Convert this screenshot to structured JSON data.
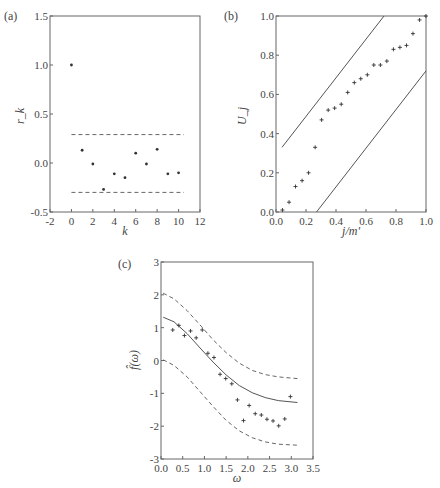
{
  "chart_data": [
    {
      "panel": "(a)",
      "type": "scatter",
      "title": "",
      "xlabel": "k",
      "ylabel": "r_k",
      "xlim": [
        -2,
        12
      ],
      "ylim": [
        -0.5,
        1.5
      ],
      "xticks": [
        "-2",
        "0",
        "2",
        "4",
        "6",
        "8",
        "10",
        "12"
      ],
      "yticks": [
        "-0.5",
        "0.0",
        "0.5",
        "1.0",
        "1.5"
      ],
      "x": [
        0,
        1,
        2,
        3,
        4,
        5,
        6,
        7,
        8,
        9,
        10
      ],
      "values": [
        1.0,
        0.13,
        -0.01,
        -0.27,
        -0.11,
        -0.15,
        0.1,
        -0.01,
        0.14,
        -0.11,
        -0.1
      ],
      "reference_lines": [
        {
          "style": "dashed",
          "y": 0.29,
          "x_range": [
            0,
            10.5
          ]
        },
        {
          "style": "dashed",
          "y": -0.3,
          "x_range": [
            0,
            10.5
          ]
        }
      ],
      "grid": false
    },
    {
      "panel": "(b)",
      "type": "scatter",
      "title": "",
      "xlabel": "j/m'",
      "ylabel": "U_j",
      "xlim": [
        0.0,
        1.0
      ],
      "ylim": [
        0.0,
        1.0
      ],
      "xticks": [
        "0.0",
        "0.2",
        "0.4",
        "0.6",
        "0.8",
        "1.0"
      ],
      "yticks": [
        "0.0",
        "0.2",
        "0.4",
        "0.6",
        "0.8",
        "1.0"
      ],
      "x": [
        0.043,
        0.087,
        0.13,
        0.174,
        0.217,
        0.261,
        0.304,
        0.348,
        0.391,
        0.435,
        0.478,
        0.522,
        0.565,
        0.609,
        0.652,
        0.696,
        0.739,
        0.783,
        0.826,
        0.87,
        0.913,
        0.957,
        1.0
      ],
      "values": [
        0.01,
        0.05,
        0.13,
        0.16,
        0.2,
        0.33,
        0.47,
        0.52,
        0.53,
        0.55,
        0.61,
        0.66,
        0.68,
        0.7,
        0.75,
        0.75,
        0.77,
        0.83,
        0.84,
        0.85,
        0.91,
        0.98,
        1.0
      ],
      "reference_lines": [
        {
          "style": "solid",
          "from": [
            0.04,
            0.33
          ],
          "to": [
            0.72,
            1.0
          ]
        },
        {
          "style": "solid",
          "from": [
            0.27,
            0.0
          ],
          "to": [
            1.0,
            0.72
          ]
        }
      ],
      "grid": false
    },
    {
      "panel": "(c)",
      "type": "scatter",
      "title": "",
      "xlabel": "ω",
      "ylabel": "f̂(ω)",
      "xlim": [
        0.0,
        3.5
      ],
      "ylim": [
        -3,
        3
      ],
      "xticks": [
        "0.0",
        "0.5",
        "1.0",
        "1.5",
        "2.0",
        "2.5",
        "3.0",
        "3.5"
      ],
      "yticks": [
        "-3",
        "-2",
        "-1",
        "0",
        "1",
        "2",
        "3"
      ],
      "x": [
        0.27,
        0.41,
        0.54,
        0.68,
        0.81,
        0.95,
        1.08,
        1.22,
        1.36,
        1.49,
        1.63,
        1.76,
        1.9,
        2.03,
        2.17,
        2.31,
        2.44,
        2.58,
        2.71,
        2.85,
        2.98
      ],
      "values": [
        0.93,
        1.07,
        0.76,
        0.9,
        0.69,
        0.93,
        0.22,
        0.09,
        -0.42,
        -0.55,
        -0.71,
        -1.2,
        -1.83,
        -1.37,
        -1.62,
        -1.66,
        -1.79,
        -1.84,
        -1.99,
        -1.78,
        -1.1
      ],
      "series": [
        {
          "name": "fitted",
          "style": "solid",
          "x": [
            0.05,
            0.3,
            0.6,
            0.9,
            1.2,
            1.5,
            1.8,
            2.1,
            2.4,
            2.7,
            3.14
          ],
          "y": [
            1.32,
            1.18,
            0.82,
            0.38,
            -0.05,
            -0.44,
            -0.76,
            -0.98,
            -1.13,
            -1.22,
            -1.28
          ]
        },
        {
          "name": "upper band",
          "style": "dashed",
          "x": [
            0.05,
            0.3,
            0.6,
            0.9,
            1.2,
            1.5,
            1.8,
            2.1,
            2.4,
            2.7,
            3.14
          ],
          "y": [
            2.05,
            1.88,
            1.52,
            1.08,
            0.63,
            0.24,
            -0.08,
            -0.3,
            -0.43,
            -0.5,
            -0.55
          ]
        },
        {
          "name": "lower band",
          "style": "dashed",
          "x": [
            0.05,
            0.3,
            0.6,
            0.9,
            1.2,
            1.5,
            1.8,
            2.1,
            2.4,
            2.7,
            3.14
          ],
          "y": [
            0.02,
            -0.15,
            -0.5,
            -0.95,
            -1.4,
            -1.82,
            -2.14,
            -2.35,
            -2.48,
            -2.55,
            -2.58
          ]
        }
      ],
      "grid": false
    }
  ]
}
